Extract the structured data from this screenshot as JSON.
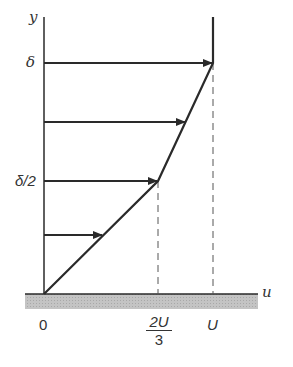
{
  "diagram": {
    "axes": {
      "x_label": "u",
      "y_label": "y"
    },
    "y_ticks": [
      {
        "label": "δ"
      },
      {
        "label": "δ/2"
      }
    ],
    "x_ticks": [
      {
        "label": "0"
      },
      {
        "label_num": "2U",
        "label_den": "3"
      },
      {
        "label": "U"
      }
    ],
    "profile_points": [
      [
        0,
        0
      ],
      [
        0.6667,
        0.5
      ],
      [
        1,
        1
      ]
    ],
    "arrows_at_y_fraction": [
      0.25,
      0.5,
      0.75,
      1.0
    ],
    "colors": {
      "line": "#2a2a2a",
      "wall": "#bdbdbd",
      "dashed": "#555555"
    }
  }
}
